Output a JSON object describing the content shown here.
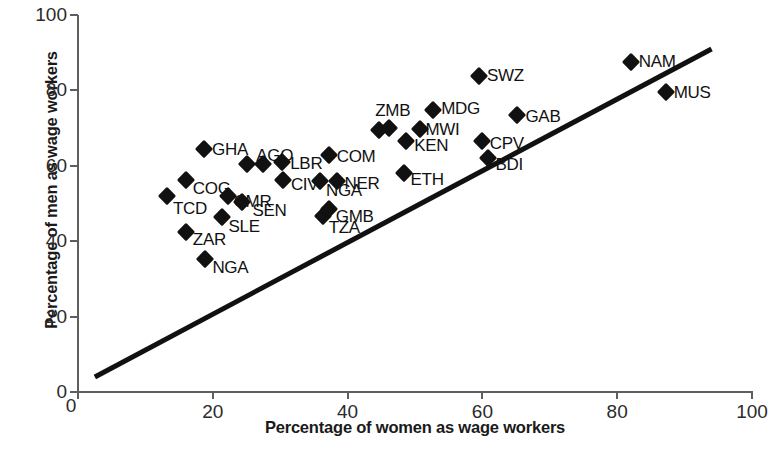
{
  "chart_data": {
    "type": "scatter",
    "title": "",
    "xlabel": "Percentage of women as wage workers",
    "ylabel": "Percentage of men as wage workers",
    "xlim": [
      0,
      100
    ],
    "ylim": [
      0,
      100
    ],
    "xticks": [
      0,
      20,
      40,
      60,
      80,
      100
    ],
    "yticks": [
      0,
      20,
      40,
      60,
      80,
      100
    ],
    "grid": false,
    "legend": null,
    "reference_line": {
      "label": "",
      "x": [
        2.5,
        94
      ],
      "y": [
        4,
        91
      ]
    },
    "points": [
      {
        "label": "TCD",
        "x": 13.2,
        "y": 52.0,
        "label_dx": 6,
        "label_dy": 13
      },
      {
        "label": "COG",
        "x": 16.0,
        "y": 56.3,
        "label_dx": 7,
        "label_dy": 9
      },
      {
        "label": "ZAR",
        "x": 16.0,
        "y": 42.5,
        "label_dx": 7,
        "label_dy": 8
      },
      {
        "label": "GHA",
        "x": 18.7,
        "y": 64.5,
        "label_dx": 8,
        "label_dy": 1
      },
      {
        "label": "NGA",
        "x": 18.9,
        "y": 35.2,
        "label_dx": 7,
        "label_dy": 9
      },
      {
        "label": "SLE",
        "x": 21.3,
        "y": 46.4,
        "label_dx": 7,
        "label_dy": 10
      },
      {
        "label": "CMR",
        "x": 22.2,
        "y": 52.0,
        "label_dx": 6,
        "label_dy": 6
      },
      {
        "label": "AGO",
        "x": 25.1,
        "y": 60.6,
        "label_dx": 9,
        "label_dy": -8
      },
      {
        "label": "SEN",
        "x": 24.4,
        "y": 50.4,
        "label_dx": 10,
        "label_dy": 9
      },
      {
        "label": "LBR",
        "x": 30.3,
        "y": 61.0,
        "label_dx": 8,
        "label_dy": 2
      },
      {
        "label": "CIV",
        "x": 30.4,
        "y": 56.2,
        "label_dx": 8,
        "label_dy": 5
      },
      {
        "label": "",
        "x": 27.5,
        "y": 60.6,
        "label_dx": 0,
        "label_dy": 0
      },
      {
        "label": "TZA",
        "x": 36.3,
        "y": 46.7,
        "label_dx": 6,
        "label_dy": 12
      },
      {
        "label": "NGA",
        "x": 35.9,
        "y": 55.9,
        "label_dx": 6,
        "label_dy": 10
      },
      {
        "label": "GMB",
        "x": 37.2,
        "y": 48.6,
        "label_dx": 7,
        "label_dy": 8
      },
      {
        "label": "COM",
        "x": 37.2,
        "y": 62.9,
        "label_dx": 8,
        "label_dy": 2
      },
      {
        "label": "NER",
        "x": 38.5,
        "y": 56.0,
        "label_dx": 7,
        "label_dy": 3
      },
      {
        "label": "ZMB",
        "x": 44.7,
        "y": 69.5,
        "label_dx": -4,
        "label_dy": -19
      },
      {
        "label": "",
        "x": 46.2,
        "y": 70.0,
        "label_dx": 0,
        "label_dy": 0
      },
      {
        "label": "ETH",
        "x": 48.3,
        "y": 58.2,
        "label_dx": 7,
        "label_dy": 7
      },
      {
        "label": "KEN",
        "x": 48.7,
        "y": 66.7,
        "label_dx": 8,
        "label_dy": 5
      },
      {
        "label": "MWI",
        "x": 50.8,
        "y": 69.8,
        "label_dx": 5,
        "label_dy": 1
      },
      {
        "label": "MDG",
        "x": 52.7,
        "y": 74.7,
        "label_dx": 8,
        "label_dy": -1
      },
      {
        "label": "SWZ",
        "x": 59.5,
        "y": 83.9,
        "label_dx": 8,
        "label_dy": 0
      },
      {
        "label": "CPV",
        "x": 59.9,
        "y": 66.7,
        "label_dx": 8,
        "label_dy": 3
      },
      {
        "label": "BDI",
        "x": 60.9,
        "y": 62.2,
        "label_dx": 7,
        "label_dy": 7
      },
      {
        "label": "GAB",
        "x": 65.2,
        "y": 73.5,
        "label_dx": 8,
        "label_dy": 2
      },
      {
        "label": "NAM",
        "x": 82.0,
        "y": 87.6,
        "label_dx": 8,
        "label_dy": 0
      },
      {
        "label": "MUS",
        "x": 87.2,
        "y": 79.7,
        "label_dx": 8,
        "label_dy": 1
      }
    ]
  },
  "axes": {
    "x": {
      "title": "Percentage of women as wage workers",
      "tick_labels": [
        "0",
        "20",
        "40",
        "60",
        "80",
        "100"
      ]
    },
    "y": {
      "title": "Percentage of men as wage workers",
      "tick_labels": [
        "0",
        "20",
        "40",
        "60",
        "80",
        "100"
      ]
    }
  },
  "style": {
    "marker_color": "#111111",
    "axis_color": "#5e5e5e",
    "line_color": "#111111",
    "background": "#ffffff"
  }
}
